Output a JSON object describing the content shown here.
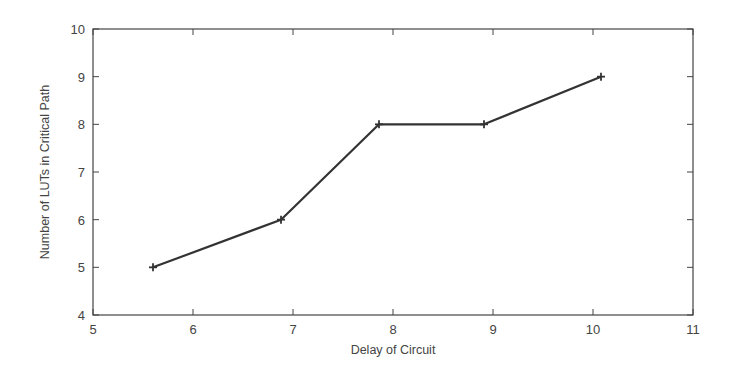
{
  "chart_data": {
    "type": "line",
    "title": "",
    "xlabel": "Delay of Circuit",
    "ylabel": "Number of LUTs in Critical Path",
    "xlim": [
      5,
      11
    ],
    "ylim": [
      4,
      10
    ],
    "xticks": [
      5,
      6,
      7,
      8,
      9,
      10,
      11
    ],
    "yticks": [
      4,
      5,
      6,
      7,
      8,
      9,
      10
    ],
    "grid": false,
    "legend": null,
    "series": [
      {
        "name": "LUTs vs Delay",
        "marker": "plus",
        "color": "#333333",
        "x": [
          5.6,
          6.88,
          7.86,
          8.91,
          10.08
        ],
        "y": [
          5,
          6,
          8,
          8,
          9
        ]
      }
    ]
  },
  "colors": {
    "line": "#333333",
    "frame": "#444444",
    "text": "#444444"
  }
}
